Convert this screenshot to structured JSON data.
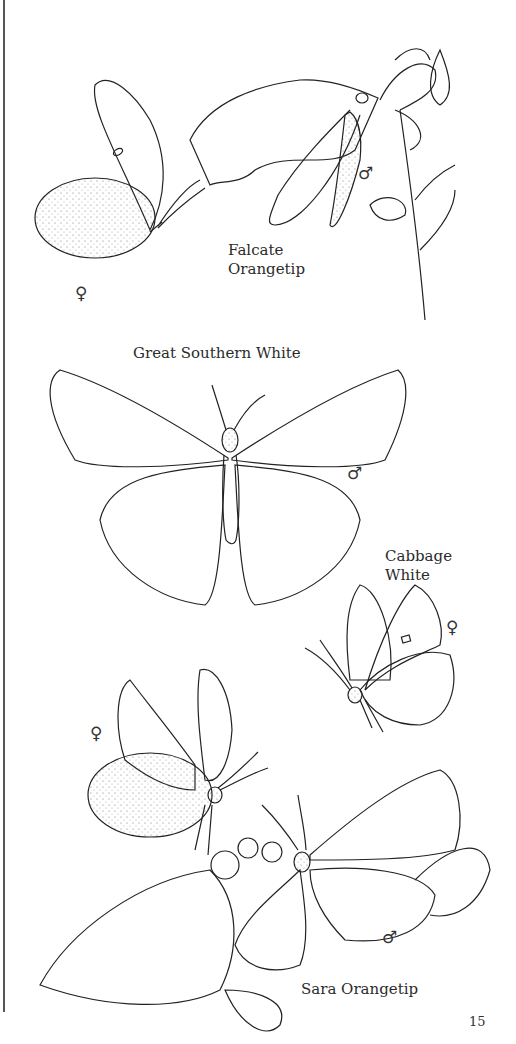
{
  "page": {
    "page_number": "15",
    "species": [
      {
        "id": "falcate-orangetip",
        "label_lines": [
          "Falcate",
          "Orangetip"
        ],
        "symbols": [
          "♀",
          "♂"
        ]
      },
      {
        "id": "great-southern-white",
        "label_lines": [
          "Great Southern White"
        ],
        "symbols": [
          "♂"
        ]
      },
      {
        "id": "cabbage-white",
        "label_lines": [
          "Cabbage",
          "White"
        ],
        "symbols": [
          "♀"
        ]
      },
      {
        "id": "sara-orangetip",
        "label_lines": [
          "Sara Orangetip"
        ],
        "symbols": [
          "♀",
          "♂"
        ]
      }
    ]
  },
  "colors": {
    "ink": "#222222",
    "paper": "#ffffff",
    "stipple": "#888888"
  }
}
